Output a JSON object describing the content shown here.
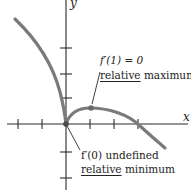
{
  "figure": {
    "axes": {
      "x_label": "x",
      "y_label": "y",
      "origin": [
        0,
        0
      ],
      "x_ticks": [
        -2,
        -1,
        1,
        2,
        3
      ],
      "y_ticks": [
        -2,
        -1,
        1,
        2,
        3
      ]
    },
    "annotations": [
      {
        "id": "max",
        "line1": "f′(1) = 0",
        "line2_underlined": "relative",
        "line2_rest": " maximum",
        "point": [
          1,
          0.6
        ]
      },
      {
        "id": "min",
        "line1": "f′(0) undefined",
        "line2_underlined": "relative",
        "line2_rest": " minimum",
        "point": [
          0,
          0
        ]
      }
    ],
    "colors": {
      "axis": "#2a2a2a",
      "curve": "#7a7a7a",
      "text": "#222222"
    }
  }
}
